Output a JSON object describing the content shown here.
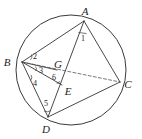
{
  "figure": {
    "type": "circle-geometry-diagram",
    "background_color": "#ffffff",
    "stroke_color": "#343434",
    "dashed_color": "#555555"
  },
  "circle": {
    "center_x": 71,
    "center_y": 70,
    "radius": 55
  },
  "points": [
    {
      "name": "A",
      "label": "A",
      "x": 84,
      "y": 21,
      "label_x": 85,
      "label_y": 15,
      "on_circle": true
    },
    {
      "name": "B",
      "label": "B",
      "x": 22,
      "y": 62,
      "label_x": 7,
      "label_y": 66,
      "on_circle": true
    },
    {
      "name": "C",
      "label": "C",
      "x": 120,
      "y": 82,
      "label_x": 125,
      "label_y": 88,
      "on_circle": true
    },
    {
      "name": "D",
      "label": "D",
      "x": 48,
      "y": 117,
      "label_x": 45,
      "label_y": 131,
      "on_circle": true
    },
    {
      "name": "E",
      "label": "E",
      "x": 62,
      "y": 85,
      "label_x": 65,
      "label_y": 94,
      "on_circle": false
    },
    {
      "name": "G",
      "label": "G",
      "x": 57,
      "y": 70,
      "label_x": 57,
      "label_y": 68,
      "on_circle": false
    }
  ],
  "segments": [
    {
      "name": "AB",
      "from": "A",
      "to": "B",
      "style": "solid"
    },
    {
      "name": "AC",
      "from": "A",
      "to": "C",
      "style": "solid"
    },
    {
      "name": "AD",
      "from": "A",
      "to": "D",
      "style": "solid"
    },
    {
      "name": "BD",
      "from": "B",
      "to": "D",
      "style": "solid"
    },
    {
      "name": "DC",
      "from": "D",
      "to": "C",
      "style": "solid"
    },
    {
      "name": "BE",
      "from": "B",
      "to": "E",
      "style": "solid"
    },
    {
      "name": "BG",
      "from": "B",
      "to": "G",
      "style": "solid"
    },
    {
      "name": "BC",
      "from": "B",
      "to": "C",
      "style": "dashed"
    }
  ],
  "angles": [
    {
      "id": "1",
      "label": "1",
      "vertex": "A",
      "label_x": 82,
      "label_y": 37
    },
    {
      "id": "2",
      "label": "2",
      "vertex": "B",
      "label_x": 33,
      "label_y": 60
    },
    {
      "id": "3",
      "label": "3",
      "vertex": "B",
      "label_x": 38,
      "label_y": 72
    },
    {
      "id": "4",
      "label": "4",
      "vertex": "B",
      "label_x": 33,
      "label_y": 84
    },
    {
      "id": "5",
      "label": "5",
      "vertex": "D",
      "label_x": 45,
      "label_y": 104
    },
    {
      "id": "6",
      "label": "6",
      "vertex": "E",
      "label_x": 54,
      "label_y": 82
    }
  ]
}
